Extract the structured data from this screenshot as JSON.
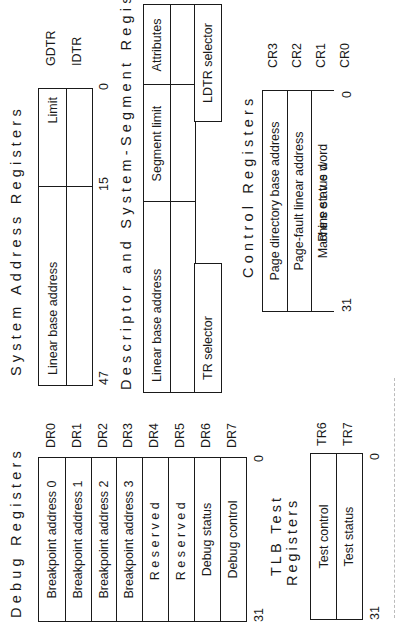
{
  "system_address": {
    "title": "System Address Registers",
    "fields": [
      "Linear base address",
      "Limit"
    ],
    "registers": [
      "GDTR",
      "IDTR"
    ],
    "bits": {
      "high": "47",
      "mid": "15",
      "low": "0"
    }
  },
  "descriptor": {
    "title": "Descriptor and System-Segment Registers",
    "fields": [
      "Linear base address",
      "Segment limit",
      "Attributes"
    ],
    "selectors": {
      "tr": "TR selector",
      "ldtr": "LDTR selector"
    }
  },
  "control": {
    "title": "Control Registers",
    "rows": [
      {
        "label": "Page directory base address",
        "reg": "CR3"
      },
      {
        "label": "Page-fault linear address",
        "reg": "CR2"
      },
      {
        "label": "Reserved",
        "reg": "CR1"
      },
      {
        "label": "Machine status word",
        "reg": "CR0"
      }
    ],
    "bits": {
      "high": "31",
      "low": "0"
    }
  },
  "debug": {
    "title": "Debug Registers",
    "rows": [
      {
        "label": "Breakpoint address 0",
        "reg": "DR0"
      },
      {
        "label": "Breakpoint address 1",
        "reg": "DR1"
      },
      {
        "label": "Breakpoint address 2",
        "reg": "DR2"
      },
      {
        "label": "Breakpoint address 3",
        "reg": "DR3"
      },
      {
        "label": "Reserved",
        "reg": "DR4"
      },
      {
        "label": "Reserved",
        "reg": "DR5"
      },
      {
        "label": "Debug status",
        "reg": "DR6"
      },
      {
        "label": "Debug control",
        "reg": "DR7"
      }
    ],
    "bits": {
      "high": "31",
      "low": "0"
    }
  },
  "tlb": {
    "title_line1": "TLB Test",
    "title_line2": "Registers",
    "rows": [
      {
        "label": "Test control",
        "reg": "TR6"
      },
      {
        "label": "Test status",
        "reg": "TR7"
      }
    ],
    "bits": {
      "high": "31",
      "low": "0"
    }
  }
}
